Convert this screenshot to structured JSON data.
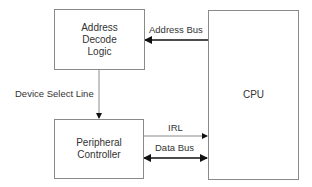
{
  "diagram": {
    "type": "block-diagram",
    "nodes": [
      {
        "id": "address_decode",
        "label_lines": [
          "Address",
          "Decode",
          "Logic"
        ]
      },
      {
        "id": "peripheral",
        "label_lines": [
          "Peripheral",
          "Controller"
        ]
      },
      {
        "id": "cpu",
        "label_lines": [
          "CPU"
        ]
      }
    ],
    "edges": [
      {
        "from": "cpu",
        "to": "address_decode",
        "label": "Address Bus",
        "direction": "one-way"
      },
      {
        "from": "address_decode",
        "to": "peripheral",
        "label": "Device Select Line",
        "direction": "one-way"
      },
      {
        "from": "peripheral",
        "to": "cpu",
        "label": "IRL",
        "direction": "one-way"
      },
      {
        "from": "peripheral",
        "to": "cpu",
        "label": "Data Bus",
        "direction": "two-way"
      }
    ]
  },
  "labels": {
    "address_decode": {
      "l1": "Address",
      "l2": "Decode",
      "l3": "Logic"
    },
    "peripheral": {
      "l1": "Peripheral",
      "l2": "Controller"
    },
    "cpu": "CPU",
    "address_bus": "Address Bus",
    "device_select": "Device Select Line",
    "irl": "IRL",
    "data_bus": "Data Bus"
  },
  "colors": {
    "line": "#8a8a8a",
    "arrow": "#111111",
    "text": "#333333"
  }
}
